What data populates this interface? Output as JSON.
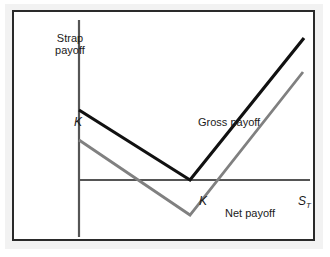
{
  "figure": {
    "kind": "payoff-diagram",
    "background_color": "#ffffff",
    "frame_color": "#2a2a2a",
    "mat_color": "#f2f2f2"
  },
  "labels": {
    "y_axis_line1": "Strap",
    "y_axis_line2": "payoff",
    "y_axis_full": "Strap payoff",
    "x_axis": "S",
    "x_axis_subscript": "T",
    "k_on_y_axis": "K",
    "k_on_x_axis": "K",
    "gross_series": "Gross payoff",
    "net_series": "Net payoff"
  },
  "colors": {
    "gross_payoff": "#111111",
    "net_payoff": "#808080",
    "axis": "#555555"
  },
  "chart_data": {
    "type": "line",
    "title": "",
    "subtitle": "",
    "xlabel": "S_T",
    "ylabel": "Strap payoff",
    "grid": false,
    "legend": "inline-annotations",
    "axis_style": "schematic",
    "xlim": [
      0,
      1
    ],
    "ylim": [
      -0.35,
      1.0
    ],
    "x_ticks": [
      {
        "value": 0.45,
        "label": "K"
      }
    ],
    "y_ticks": [
      {
        "value": 0.42,
        "label": "K"
      }
    ],
    "annotations": [
      {
        "text": "Gross payoff",
        "x": 0.48,
        "y": 0.46,
        "color": "#111111"
      },
      {
        "text": "Net payoff",
        "x": 0.6,
        "y": -0.11,
        "color": "#808080"
      }
    ],
    "series": [
      {
        "name": "Gross payoff",
        "color": "#111111",
        "width": 3,
        "points": [
          {
            "x": 0.0,
            "y": 0.42
          },
          {
            "x": 0.45,
            "y": 0.0
          },
          {
            "x": 1.0,
            "y": 0.84
          }
        ],
        "note": "2 puts + 1 call straddle-type payoff, kink at strike K"
      },
      {
        "name": "Net payoff",
        "color": "#808080",
        "width": 2.5,
        "points": [
          {
            "x": 0.0,
            "y": 0.28
          },
          {
            "x": 0.45,
            "y": -0.16
          },
          {
            "x": 1.0,
            "y": 0.68
          }
        ],
        "note": "gross payoff shifted down by the premium paid"
      }
    ]
  },
  "geometry": {
    "y_axis_x": 79,
    "y_axis_top": 20,
    "y_axis_bottom": 237,
    "x_axis_y": 180,
    "x_axis_left": 79,
    "x_axis_right": 310,
    "gross": [
      [
        79,
        110
      ],
      [
        190,
        180
      ],
      [
        304,
        38
      ]
    ],
    "net": [
      [
        79,
        140
      ],
      [
        190,
        215
      ],
      [
        303,
        72
      ]
    ]
  }
}
